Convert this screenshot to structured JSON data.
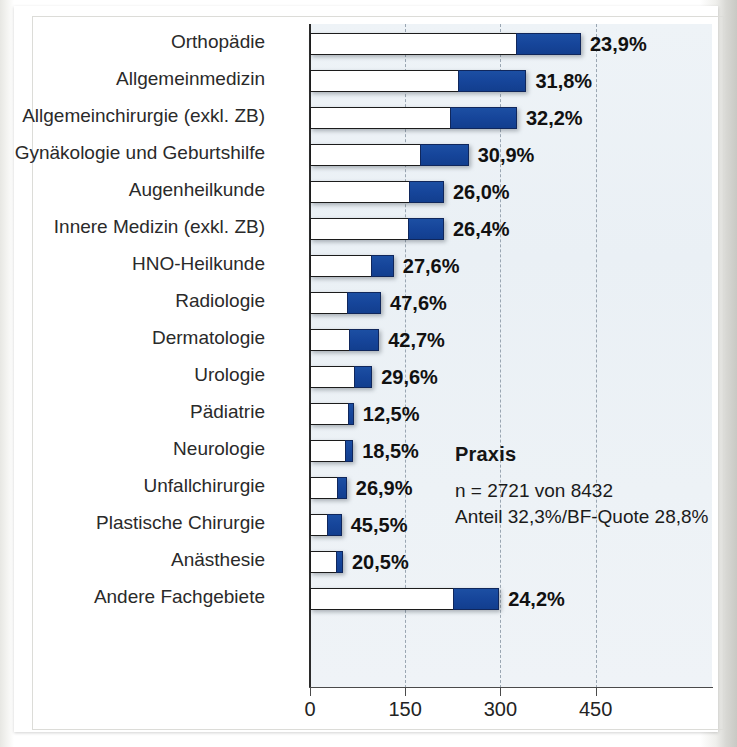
{
  "chart_data": {
    "type": "bar",
    "orientation": "horizontal",
    "stacked": true,
    "title": "",
    "xlabel": "",
    "ylabel": "",
    "xlim": [
      0,
      634
    ],
    "xticks": [
      0,
      150,
      300,
      450
    ],
    "xticklabels": [
      "0",
      "150",
      "300",
      "450"
    ],
    "grid": "vertical-dashed",
    "legend": "none",
    "series": [
      {
        "name": "Gesamt (weiss)",
        "color": "#ffffff"
      },
      {
        "name": "Anteil (blau)",
        "color": "#16459a"
      }
    ],
    "categories": [
      "Orthopädie",
      "Allgemeinmedizin",
      "Allgemeinchirurgie (exkl. ZB)",
      "Gynäkologie und Geburtshilfe",
      "Augenheilkunde",
      "Innere Medizin (exkl. ZB)",
      "HNO-Heilkunde",
      "Radiologie",
      "Dermatologie",
      "Urologie",
      "Pädiatrie",
      "Neurologie",
      "Unfallchirurgie",
      "Plastische Chirurgie",
      "Anästhesie",
      "Andere Fachgebiete"
    ],
    "totals": [
      427,
      341,
      326,
      250,
      211,
      211,
      132,
      112,
      109,
      98,
      69,
      68,
      58,
      50,
      52,
      298
    ],
    "blue_values": [
      102,
      108,
      105,
      77,
      55,
      56,
      36,
      53,
      47,
      29,
      9,
      13,
      16,
      23,
      11,
      72
    ],
    "white_values": [
      325,
      233,
      221,
      173,
      156,
      155,
      96,
      59,
      62,
      69,
      60,
      55,
      42,
      27,
      41,
      226
    ],
    "percent_labels": [
      "23,9%",
      "31,8%",
      "32,2%",
      "30,9%",
      "26,0%",
      "26,4%",
      "27,6%",
      "47,6%",
      "42,7%",
      "29,6%",
      "12,5%",
      "18,5%",
      "26,9%",
      "45,5%",
      "20,5%",
      "24,2%"
    ],
    "percent_values": [
      23.9,
      31.8,
      32.2,
      30.9,
      26.0,
      26.4,
      27.6,
      47.6,
      42.7,
      29.6,
      12.5,
      18.5,
      26.9,
      45.5,
      20.5,
      24.2
    ],
    "annotation": {
      "title": "Praxis",
      "line1": "n = 2721 von 8432",
      "line2": "Anteil 32,3%/BF-Quote 28,8%"
    },
    "colors": {
      "blue": "#16459a",
      "white": "#ffffff",
      "outline": "#1c1c1c",
      "plot_bg": "#eaf0f5",
      "gridline": "#9aa6b2",
      "text": "#2a2a2a"
    }
  }
}
